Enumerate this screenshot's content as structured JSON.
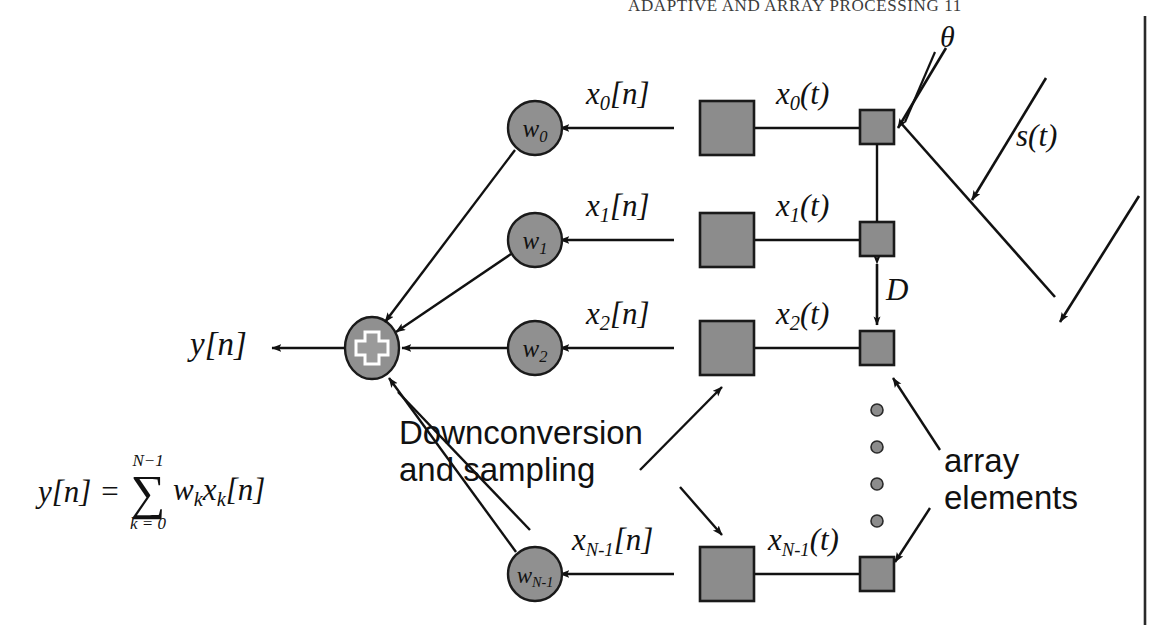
{
  "page": {
    "header_text": "ADAPTIVE AND ARRAY PROCESSING  11",
    "background": "#ffffff",
    "width": 1159,
    "height": 625
  },
  "colors": {
    "block_fill": "#8c8c8c",
    "block_stroke": "#1a1a1a",
    "node_fill": "#909090",
    "line": "#111111",
    "text": "#111111"
  },
  "diagram": {
    "output_label": "y[n]",
    "sum_node": {
      "name": "summation-node",
      "symbol": "+"
    },
    "angle_label": "θ",
    "source_label": "s(t)",
    "spacing_label": "D",
    "annotations": [
      {
        "id": "downconversion",
        "line1": "Downconversion",
        "line2": "and sampling"
      },
      {
        "id": "array-elements",
        "line1": "array",
        "line2": "elements"
      }
    ],
    "ellipsis_dots": 4,
    "channels": [
      {
        "index": 0,
        "weight": "w",
        "weight_sub": "0",
        "digital_label": "x",
        "digital_sub": "0",
        "digital_suffix": "[n]",
        "analog_label": "x",
        "analog_sub": "0",
        "analog_suffix": "(t)"
      },
      {
        "index": 1,
        "weight": "w",
        "weight_sub": "1",
        "digital_label": "x",
        "digital_sub": "1",
        "digital_suffix": "[n]",
        "analog_label": "x",
        "analog_sub": "1",
        "analog_suffix": "(t)"
      },
      {
        "index": 2,
        "weight": "w",
        "weight_sub": "2",
        "digital_label": "x",
        "digital_sub": "2",
        "digital_suffix": "[n]",
        "analog_label": "x",
        "analog_sub": "2",
        "analog_suffix": "(t)"
      },
      {
        "index": 3,
        "weight": "w",
        "weight_sub": "N-1",
        "digital_label": "x",
        "digital_sub": "N-1",
        "digital_suffix": "[n]",
        "analog_label": "x",
        "analog_sub": "N-1",
        "analog_suffix": "(t)"
      }
    ],
    "equation": {
      "lhs": "y[n] =",
      "sigma_upper": "N−1",
      "sigma_glyph": "∑",
      "sigma_lower": "k = 0",
      "rhs_w": "w",
      "rhs_w_sub": "k",
      "rhs_x": "x",
      "rhs_x_sub": "k",
      "rhs_suffix": "[n]"
    }
  }
}
